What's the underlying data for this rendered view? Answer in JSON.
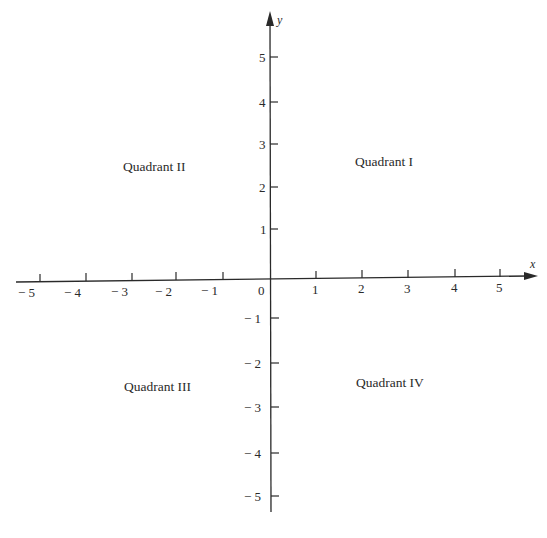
{
  "diagram": {
    "axes": {
      "x_label": "x",
      "y_label": "y",
      "origin_label": "0",
      "x_ticks": [
        {
          "value": -5,
          "label": "− 5"
        },
        {
          "value": -4,
          "label": "− 4"
        },
        {
          "value": -3,
          "label": "− 3"
        },
        {
          "value": -2,
          "label": "− 2"
        },
        {
          "value": -1,
          "label": "− 1"
        },
        {
          "value": 1,
          "label": "1"
        },
        {
          "value": 2,
          "label": "2"
        },
        {
          "value": 3,
          "label": "3"
        },
        {
          "value": 4,
          "label": "4"
        },
        {
          "value": 5,
          "label": "5"
        }
      ],
      "y_ticks": [
        {
          "value": 5,
          "label": "5"
        },
        {
          "value": 4,
          "label": "4"
        },
        {
          "value": 3,
          "label": "3"
        },
        {
          "value": 2,
          "label": "2"
        },
        {
          "value": 1,
          "label": "1"
        },
        {
          "value": -1,
          "label": "− 1"
        },
        {
          "value": -2,
          "label": "− 2"
        },
        {
          "value": -3,
          "label": "− 3"
        },
        {
          "value": -4,
          "label": "− 4"
        },
        {
          "value": -5,
          "label": "− 5"
        }
      ]
    },
    "quadrants": {
      "q1": "Quadrant I",
      "q2": "Quadrant II",
      "q3": "Quadrant III",
      "q4": "Quadrant IV"
    },
    "colors": {
      "ink": "#2a2a2a",
      "background": "#ffffff"
    }
  }
}
